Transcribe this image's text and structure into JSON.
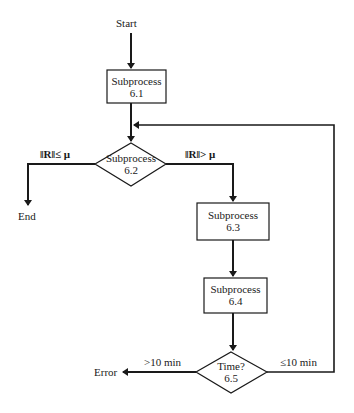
{
  "diagram": {
    "type": "flowchart",
    "start_label": "Start",
    "end_label": "End",
    "error_label": "Error",
    "nodes": [
      {
        "id": "6.1",
        "shape": "rect",
        "title": "Subprocess",
        "number": "6.1"
      },
      {
        "id": "6.2",
        "shape": "diamond",
        "title": "Subprocess",
        "number": "6.2"
      },
      {
        "id": "6.3",
        "shape": "rect",
        "title": "Subprocess",
        "number": "6.3"
      },
      {
        "id": "6.4",
        "shape": "rect",
        "title": "Subprocess",
        "number": "6.4"
      },
      {
        "id": "6.5",
        "shape": "diamond",
        "title": "Time?",
        "number": "6.5"
      }
    ],
    "edges": {
      "r_le_mu": "‖R‖≤ μ",
      "r_gt_mu": "‖R‖> μ",
      "gt_10": ">10 min",
      "le_10": "≤10 min"
    },
    "colors": {
      "line": "#1a1a1a",
      "background": "#ffffff"
    }
  }
}
